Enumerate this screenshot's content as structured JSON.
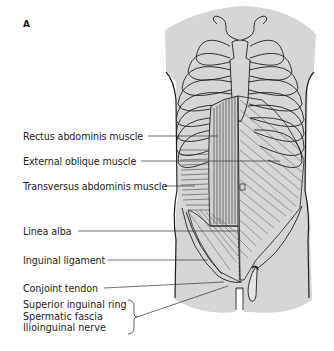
{
  "figure": {
    "panel_letter": "A",
    "colors": {
      "body_fill": "#d6d6d6",
      "outline": "#1e1e1e",
      "muscle_line": "#3a3a3a",
      "leader_line": "#333333",
      "text": "#222222"
    },
    "labels": [
      {
        "text": "Rectus abdominis muscle"
      },
      {
        "text": "External oblique muscle"
      },
      {
        "text": "Transversus abdominis muscle"
      },
      {
        "text": "Linea alba"
      },
      {
        "text": "Inguinal ligament"
      },
      {
        "text": "Conjoint tendon"
      }
    ],
    "bracket_group": [
      {
        "text": "Superior inguinal ring"
      },
      {
        "text": "Spermatic fascia"
      },
      {
        "text": "Ilioinguinal nerve"
      }
    ]
  }
}
